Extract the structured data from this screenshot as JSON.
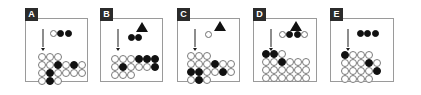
{
  "figure": {
    "background_color": "#ffffff",
    "panel_border_color": "#9a9a9a",
    "filled_color": "#111111",
    "open_color": "#ffffff",
    "open_stroke_color": "#7a7a7a",
    "arrow_color": "#8d8d8d",
    "triangle_color": "#111111",
    "panel_count": 5
  },
  "panels": [
    {
      "label": "A",
      "x": 25,
      "width": 63,
      "arrow": {
        "x": 16,
        "y": 10
      },
      "triangle": null,
      "stimulus": {
        "x": 24,
        "y": 11,
        "dots": [
          "open",
          "filled",
          "filled"
        ]
      },
      "grid": {
        "x": 12,
        "y": 34,
        "rows": 4,
        "cols": 6,
        "cells": [
          [
            "open",
            "open",
            "open",
            "empty",
            "empty",
            "empty"
          ],
          [
            "open",
            "open",
            "filled",
            "open",
            "filled",
            "open"
          ],
          [
            "open",
            "filled",
            "open",
            "open",
            "open",
            "open"
          ],
          [
            "open",
            "filled",
            "open",
            "empty",
            "empty",
            "empty"
          ]
        ]
      }
    },
    {
      "label": "B",
      "x": 100,
      "width": 63,
      "arrow": {
        "x": 16,
        "y": 10
      },
      "triangle": {
        "x": 35,
        "y": 3
      },
      "stimulus": {
        "x": 27,
        "y": 15,
        "dots": [
          "filled",
          "filled"
        ]
      },
      "grid": {
        "x": 10,
        "y": 36,
        "rows": 3,
        "cols": 6,
        "cells": [
          [
            "open",
            "open",
            "open",
            "filled",
            "filled",
            "filled"
          ],
          [
            "open",
            "filled",
            "open",
            "open",
            "open",
            "filled"
          ],
          [
            "open",
            "open",
            "open",
            "empty",
            "empty",
            "empty"
          ]
        ]
      }
    },
    {
      "label": "C",
      "x": 177,
      "width": 63,
      "arrow": {
        "x": 16,
        "y": 10
      },
      "triangle": {
        "x": 36,
        "y": 2
      },
      "stimulus": {
        "x": 27,
        "y": 12,
        "dots": [
          "open"
        ]
      },
      "grid": {
        "x": 9,
        "y": 33,
        "rows": 4,
        "cols": 6,
        "cells": [
          [
            "open",
            "open",
            "open",
            "empty",
            "empty",
            "empty"
          ],
          [
            "open",
            "open",
            "open",
            "filled",
            "open",
            "open"
          ],
          [
            "filled",
            "filled",
            "open",
            "open",
            "filled",
            "open"
          ],
          [
            "open",
            "filled",
            "open",
            "empty",
            "empty",
            "empty"
          ]
        ]
      }
    },
    {
      "label": "D",
      "x": 253,
      "width": 64,
      "arrow": {
        "x": 16,
        "y": 10
      },
      "triangle": {
        "x": 36,
        "y": 2
      },
      "stimulus": {
        "x": 25,
        "y": 12,
        "dots": [
          "open",
          "filled",
          "filled",
          "open"
        ]
      },
      "grid": {
        "x": 8,
        "y": 31,
        "rows": 4,
        "cols": 6,
        "cells": [
          [
            "filled",
            "filled",
            "open",
            "empty",
            "empty",
            "empty"
          ],
          [
            "open",
            "open",
            "filled",
            "open",
            "open",
            "open"
          ],
          [
            "open",
            "open",
            "open",
            "open",
            "open",
            "open"
          ],
          [
            "open",
            "open",
            "open",
            "open",
            "open",
            "open"
          ]
        ]
      }
    },
    {
      "label": "E",
      "x": 330,
      "width": 64,
      "arrow": {
        "x": 16,
        "y": 10
      },
      "triangle": null,
      "stimulus": {
        "x": 26,
        "y": 11,
        "dots": [
          "filled",
          "filled",
          "filled"
        ]
      },
      "grid": {
        "x": 10,
        "y": 32,
        "rows": 4,
        "cols": 5,
        "cells": [
          [
            "filled",
            "open",
            "open",
            "open",
            "empty"
          ],
          [
            "open",
            "open",
            "open",
            "filled",
            "open"
          ],
          [
            "open",
            "open",
            "open",
            "open",
            "filled"
          ],
          [
            "open",
            "open",
            "open",
            "open",
            "empty"
          ]
        ]
      }
    }
  ]
}
